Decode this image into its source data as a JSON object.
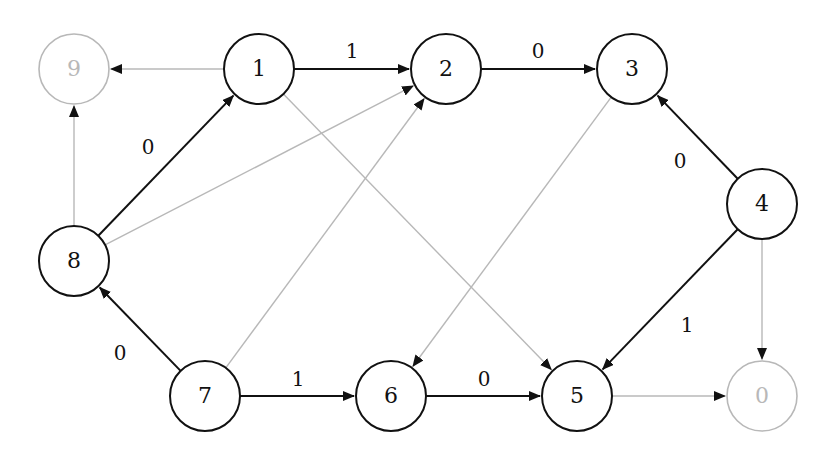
{
  "diagram": {
    "type": "directed-graph",
    "colors": {
      "active": "#111111",
      "inactive": "#b8b8b8"
    },
    "nodes": [
      {
        "id": "9",
        "label": "9",
        "x": 74,
        "y": 69,
        "active": false
      },
      {
        "id": "1",
        "label": "1",
        "x": 259,
        "y": 69,
        "active": true
      },
      {
        "id": "2",
        "label": "2",
        "x": 446,
        "y": 69,
        "active": true
      },
      {
        "id": "3",
        "label": "3",
        "x": 632,
        "y": 69,
        "active": true
      },
      {
        "id": "4",
        "label": "4",
        "x": 762,
        "y": 204,
        "active": true
      },
      {
        "id": "8",
        "label": "8",
        "x": 74,
        "y": 261,
        "active": true
      },
      {
        "id": "7",
        "label": "7",
        "x": 205,
        "y": 396,
        "active": true
      },
      {
        "id": "6",
        "label": "6",
        "x": 391,
        "y": 396,
        "active": true
      },
      {
        "id": "5",
        "label": "5",
        "x": 577,
        "y": 396,
        "active": true
      },
      {
        "id": "0",
        "label": "0",
        "x": 762,
        "y": 396,
        "active": false
      }
    ],
    "edges": [
      {
        "from": "1",
        "to": "2",
        "label": "1",
        "active": true,
        "lx": 352,
        "ly": 52
      },
      {
        "from": "2",
        "to": "3",
        "label": "0",
        "active": true,
        "lx": 538,
        "ly": 52
      },
      {
        "from": "4",
        "to": "3",
        "label": "0",
        "active": true,
        "lx": 680,
        "ly": 162
      },
      {
        "from": "8",
        "to": "1",
        "label": "0",
        "active": true,
        "lx": 148,
        "ly": 148
      },
      {
        "from": "7",
        "to": "8",
        "label": "0",
        "active": true,
        "lx": 120,
        "ly": 354
      },
      {
        "from": "7",
        "to": "6",
        "label": "1",
        "active": true,
        "lx": 298,
        "ly": 380
      },
      {
        "from": "6",
        "to": "5",
        "label": "0",
        "active": true,
        "lx": 484,
        "ly": 380
      },
      {
        "from": "4",
        "to": "5",
        "label": "1",
        "active": true,
        "lx": 687,
        "ly": 326
      },
      {
        "from": "1",
        "to": "9",
        "label": "",
        "active": false
      },
      {
        "from": "8",
        "to": "9",
        "label": "",
        "active": false
      },
      {
        "from": "8",
        "to": "2",
        "label": "",
        "active": false
      },
      {
        "from": "7",
        "to": "2",
        "label": "",
        "active": false
      },
      {
        "from": "1",
        "to": "5",
        "label": "",
        "active": false
      },
      {
        "from": "3",
        "to": "6",
        "label": "",
        "active": false
      },
      {
        "from": "4",
        "to": "0",
        "label": "",
        "active": false
      },
      {
        "from": "5",
        "to": "0",
        "label": "",
        "active": false
      }
    ]
  }
}
